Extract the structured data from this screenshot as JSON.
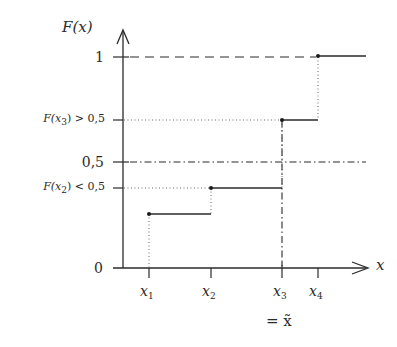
{
  "diagram": {
    "axes": {
      "y_axis_label": "F(x)",
      "x_axis_label": "x"
    },
    "y_ticks": [
      {
        "id": "one",
        "label": "1",
        "value": 1.0
      },
      {
        "id": "fx3",
        "label_main": "F(x",
        "label_sub": "3",
        "label_rest": ") > 0,5",
        "value": 0.63
      },
      {
        "id": "half",
        "label": "0,5",
        "value": 0.5
      },
      {
        "id": "fx2",
        "label_main": "F(x",
        "label_sub": "2",
        "label_rest": ") < 0,5",
        "value": 0.42
      },
      {
        "id": "zero",
        "label": "0",
        "value": 0.0
      }
    ],
    "x_ticks": [
      {
        "id": "x1",
        "label_main": "x",
        "label_sub": "1"
      },
      {
        "id": "x2",
        "label_main": "x",
        "label_sub": "2"
      },
      {
        "id": "x3",
        "label_main": "x",
        "label_sub": "3"
      },
      {
        "id": "x4",
        "label_main": "x",
        "label_sub": "4"
      }
    ],
    "median_note": "= x̃",
    "steps": [
      {
        "from": "x1",
        "to": "x2",
        "value": 0.25
      },
      {
        "from": "x2",
        "to": "x3",
        "value": "F(x2)"
      },
      {
        "from": "x3",
        "to": "x4",
        "value": "F(x3)"
      },
      {
        "from": "x4",
        "to": "∞",
        "value": 1
      }
    ],
    "line_styles": {
      "level_one": "dashed",
      "level_half": "dash-dot",
      "level_Fx": "dotted",
      "median_vertical": "dash-dot",
      "jumps": "dotted"
    },
    "colors": {
      "ink": "#2a2a2a",
      "background": "#ffffff"
    }
  }
}
